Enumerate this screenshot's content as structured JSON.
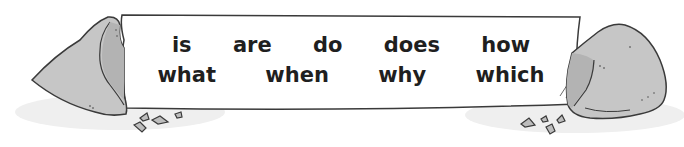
{
  "banner": {
    "row1": [
      "is",
      "are",
      "do",
      "does",
      "how"
    ],
    "row2": [
      "what",
      "when",
      "why",
      "which"
    ]
  },
  "colors": {
    "paper": "#ffffff",
    "rock": "#c8c8c8",
    "rock_shade": "#b5b5b5",
    "outline": "#3a3a3a",
    "shadow": "#ececec",
    "text": "#1f1f1f"
  }
}
